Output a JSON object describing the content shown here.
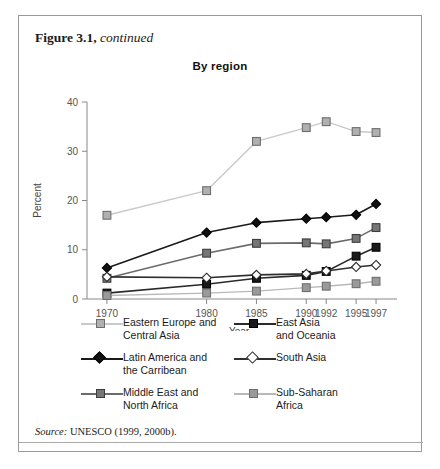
{
  "figure": {
    "caption_bold": "Figure 3.1,",
    "caption_italic": " continued",
    "source_prefix": "Source:",
    "source_text": " UNESCO (1999, 2000b)."
  },
  "chart_data": {
    "type": "line",
    "title": "By region",
    "xlabel": "Year",
    "ylabel": "Percent",
    "x": [
      1970,
      1980,
      1985,
      1990,
      1992,
      1995,
      1997
    ],
    "xtick_labels": [
      "1970",
      "1980",
      "1985",
      "1990",
      "1992",
      "1995",
      "1997"
    ],
    "ytick_labels": [
      "0",
      "10",
      "20",
      "30",
      "40"
    ],
    "yticks": [
      0,
      10,
      20,
      30,
      40
    ],
    "ylim": [
      0,
      40
    ],
    "xlim": [
      1968,
      1998.5
    ],
    "grid": false,
    "legend_position": "below",
    "series": [
      {
        "name": "Eastern Europe and Central Asia",
        "color": "#c9c9c9",
        "marker": "square",
        "marker_fill": "#b0b0b0",
        "marker_edge": "#6e6e6e",
        "values": [
          17.0,
          22.0,
          32.0,
          34.8,
          36.0,
          34.0,
          33.8
        ]
      },
      {
        "name": "Latin America and the Carribean",
        "color": "#1a1a1a",
        "marker": "diamond",
        "marker_fill": "#111111",
        "marker_edge": "#000000",
        "values": [
          6.3,
          13.5,
          15.5,
          16.3,
          16.6,
          17.1,
          19.3
        ]
      },
      {
        "name": "Middle East and North Africa",
        "color": "#6b6b6b",
        "marker": "square",
        "marker_fill": "#767676",
        "marker_edge": "#3d3d3d",
        "values": [
          4.2,
          9.3,
          11.3,
          11.4,
          11.2,
          12.3,
          14.5
        ]
      },
      {
        "name": "East Asia and Oceania",
        "color": "#2a2a2a",
        "marker": "square",
        "marker_fill": "#1a1a1a",
        "marker_edge": "#000000",
        "values": [
          1.2,
          3.0,
          4.2,
          4.8,
          5.6,
          8.7,
          10.5
        ]
      },
      {
        "name": "South Asia",
        "color": "#2f2f2f",
        "marker": "diamond",
        "marker_fill": "#ffffff",
        "marker_edge": "#2a2a2a",
        "values": [
          4.5,
          4.3,
          4.9,
          5.1,
          5.7,
          6.5,
          6.9
        ]
      },
      {
        "name": "Sub-Saharan Africa",
        "color": "#b8b8b8",
        "marker": "square",
        "marker_fill": "#9a9a9a",
        "marker_edge": "#6e6e6e",
        "values": [
          0.7,
          1.2,
          1.6,
          2.3,
          2.6,
          3.1,
          3.6
        ]
      }
    ]
  },
  "legend": {
    "left": [
      {
        "label_line1": "Eastern Europe and",
        "label_line2": "Central Asia"
      },
      {
        "label_line1": "Latin America and",
        "label_line2": "the Carribean"
      },
      {
        "label_line1": "Middle East and",
        "label_line2": "North Africa"
      }
    ],
    "right": [
      {
        "label_line1": "East Asia",
        "label_line2": "and Oceania"
      },
      {
        "label_line1": "South Asia",
        "label_line2": ""
      },
      {
        "label_line1": "Sub-Saharan",
        "label_line2": "Africa"
      }
    ]
  }
}
